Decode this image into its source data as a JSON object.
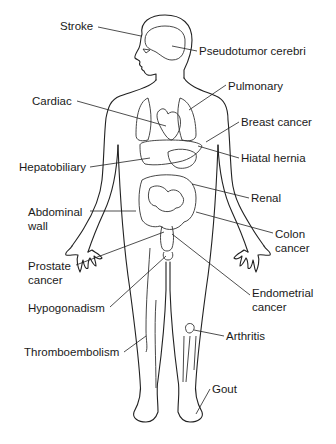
{
  "diagram": {
    "type": "anatomical-body-outline",
    "labels": [
      {
        "id": "stroke",
        "text": "Stroke",
        "x": 60,
        "y": 19
      },
      {
        "id": "pseudotumor",
        "text": "Pseudotumor cerebri",
        "x": 199,
        "y": 44
      },
      {
        "id": "pulmonary",
        "text": "Pulmonary",
        "x": 228,
        "y": 79
      },
      {
        "id": "cardiac",
        "text": "Cardiac",
        "x": 32,
        "y": 94
      },
      {
        "id": "breast",
        "text": "Breast cancer",
        "x": 241,
        "y": 115
      },
      {
        "id": "hiatal",
        "text": "Hiatal hernia",
        "x": 241,
        "y": 151
      },
      {
        "id": "hepatobiliary",
        "text": "Hepatobiliary",
        "x": 19,
        "y": 160
      },
      {
        "id": "renal",
        "text": "Renal",
        "x": 251,
        "y": 191
      },
      {
        "id": "abdominal",
        "text": "Abdominal\nwall",
        "x": 28,
        "y": 205
      },
      {
        "id": "colon",
        "text": "Colon\ncancer",
        "x": 275,
        "y": 227
      },
      {
        "id": "prostate",
        "text": "Prostate\ncancer",
        "x": 28,
        "y": 259
      },
      {
        "id": "endometrial",
        "text": "Endometrial\ncancer",
        "x": 252,
        "y": 286
      },
      {
        "id": "hypogonadism",
        "text": "Hypogonadism",
        "x": 28,
        "y": 301
      },
      {
        "id": "arthritis",
        "text": "Arthritis",
        "x": 226,
        "y": 329
      },
      {
        "id": "thromboembolism",
        "text": "Thromboembolism",
        "x": 24,
        "y": 345
      },
      {
        "id": "gout",
        "text": "Gout",
        "x": 212,
        "y": 382
      }
    ]
  }
}
